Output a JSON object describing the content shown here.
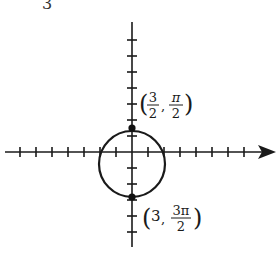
{
  "figure": {
    "type": "polar-graph",
    "top_fragment": "3",
    "axis": {
      "origin_px": [
        132,
        152
      ],
      "tick_spacing_px": 16,
      "horizontal_ticks": 16,
      "vertical_ticks_above": 7,
      "vertical_ticks_below": 5,
      "arrow": "right"
    },
    "circle": {
      "center_px": [
        132,
        164
      ],
      "radius_px": 33
    },
    "points": [
      {
        "name": "top-point",
        "px": [
          132,
          128
        ],
        "r": "3/2",
        "theta": "π/2",
        "label_r_num": "3",
        "label_r_den": "2",
        "label_t_num": "π",
        "label_t_den": "2"
      },
      {
        "name": "bottom-point",
        "px": [
          132,
          197
        ],
        "r": "3",
        "theta": "3π/2",
        "label_r": "3",
        "label_t_num": "3π",
        "label_t_den": "2"
      }
    ],
    "stroke_color": "#1a1a1a"
  }
}
